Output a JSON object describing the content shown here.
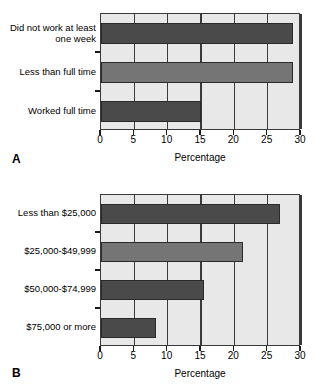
{
  "figure": {
    "panels": [
      {
        "letter": "A",
        "axis_title": "Percentage",
        "xticks": [
          "0",
          "5",
          "10",
          "15",
          "20",
          "25",
          "30"
        ],
        "categories": [
          {
            "label": "Did not work at least one week",
            "value": 28.8,
            "shade": "dark"
          },
          {
            "label": "Less than full time",
            "value": 28.8,
            "shade": "mid"
          },
          {
            "label": "Worked full time",
            "value": 15.0,
            "shade": "dark"
          }
        ]
      },
      {
        "letter": "B",
        "axis_title": "Percentage",
        "xticks": [
          "0",
          "5",
          "10",
          "15",
          "20",
          "25",
          "30"
        ],
        "categories": [
          {
            "label": "Less than $25,000",
            "value": 26.8,
            "shade": "dark"
          },
          {
            "label": "$25,000-$49,999",
            "value": 21.3,
            "shade": "mid"
          },
          {
            "label": "$50,000-$74,999",
            "value": 15.4,
            "shade": "dark"
          },
          {
            "label": "$75,000 or more",
            "value": 8.2,
            "shade": "dark"
          }
        ]
      }
    ]
  },
  "colors": {
    "bar_dark": "#4a4a4a",
    "bar_mid": "#757575",
    "plot_background": "#e8e8e8",
    "axis": "#3a3a3a"
  },
  "chart_data": [
    {
      "type": "bar",
      "orientation": "horizontal",
      "panel": "A",
      "title": "",
      "xlabel": "Percentage",
      "ylabel": "",
      "xlim": [
        0,
        30
      ],
      "xticks": [
        0,
        5,
        10,
        15,
        20,
        25,
        30
      ],
      "grid": true,
      "legend": "none",
      "categories": [
        "Did not work at least one week",
        "Less than full time",
        "Worked full time"
      ],
      "values": [
        28.8,
        28.8,
        15.0
      ],
      "bar_colors": [
        "#4a4a4a",
        "#757575",
        "#4a4a4a"
      ]
    },
    {
      "type": "bar",
      "orientation": "horizontal",
      "panel": "B",
      "title": "",
      "xlabel": "Percentage",
      "ylabel": "",
      "xlim": [
        0,
        30
      ],
      "xticks": [
        0,
        5,
        10,
        15,
        20,
        25,
        30
      ],
      "grid": true,
      "legend": "none",
      "categories": [
        "Less than $25,000",
        "$25,000-$49,999",
        "$50,000-$74,999",
        "$75,000 or more"
      ],
      "values": [
        26.8,
        21.3,
        15.4,
        8.2
      ],
      "bar_colors": [
        "#4a4a4a",
        "#757575",
        "#4a4a4a",
        "#4a4a4a"
      ]
    }
  ]
}
